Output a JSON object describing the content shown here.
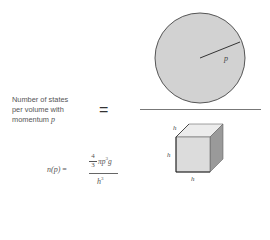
{
  "left_label": {
    "line1": "Number of states",
    "line2": "per volume with",
    "line3_prefix": "momentum ",
    "line3_var": "p"
  },
  "equals_sign": "=",
  "sphere": {
    "radius_label": "p",
    "fill": "#d2d2d2",
    "stroke": "#555555"
  },
  "cube": {
    "edge_label_top": "h",
    "edge_label_left": "h",
    "edge_label_bottom": "h",
    "front_fill": "#dcdcdc",
    "top_fill": "#ececec",
    "side_fill": "#9a9a9a"
  },
  "formula": {
    "lhs": "n(p)",
    "eq": " =",
    "frac_num": "4",
    "frac_den": "3",
    "numerator_text": "πp",
    "numerator_exp": "3",
    "numerator_tail": "g",
    "denominator_base": "h",
    "denominator_exp": "3"
  }
}
